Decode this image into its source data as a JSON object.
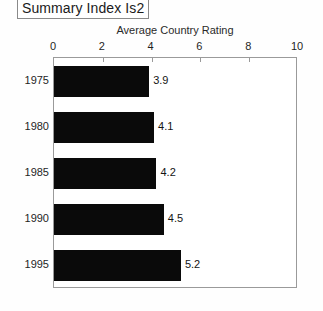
{
  "title_box": {
    "label": "Summary Index Is2"
  },
  "chart_data": {
    "type": "bar",
    "orientation": "horizontal",
    "title": "",
    "xlabel": "Average Country Rating",
    "ylabel": "",
    "categories": [
      "1975",
      "1980",
      "1985",
      "1990",
      "1995"
    ],
    "values": [
      3.9,
      4.1,
      4.2,
      4.5,
      5.2
    ],
    "value_labels": [
      "3.9",
      "4.1",
      "4.2",
      "4.5",
      "5.2"
    ],
    "xlim": [
      0,
      10
    ],
    "xticks": [
      0,
      2,
      4,
      6,
      8,
      10
    ],
    "xtick_labels": [
      "0",
      "2",
      "4",
      "6",
      "8",
      "10"
    ],
    "grid": false,
    "legend": null,
    "bar_color": "#0a0a0a",
    "frame_color": "#9a9a9a",
    "background": "#ffffff"
  }
}
